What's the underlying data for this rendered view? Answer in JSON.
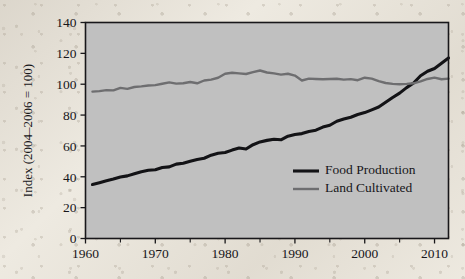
{
  "chart_data": {
    "type": "line",
    "title": "",
    "xlabel": "",
    "ylabel": "Index (2004–2006 = 100)",
    "xlim": [
      1960,
      2012
    ],
    "ylim": [
      0,
      140
    ],
    "grid": false,
    "legend_position": "inside-right-lower",
    "x_ticks": [
      1960,
      1970,
      1980,
      1990,
      2000,
      2010
    ],
    "x_ticks_minor": [
      1965,
      1975,
      1985,
      1995,
      2005
    ],
    "y_ticks": [
      0,
      20,
      40,
      60,
      80,
      100,
      120,
      140
    ],
    "plot_background": "#c3c3c3",
    "page_background": "#eeeae1",
    "x": [
      1961,
      1962,
      1963,
      1964,
      1965,
      1966,
      1967,
      1968,
      1969,
      1970,
      1971,
      1972,
      1973,
      1974,
      1975,
      1976,
      1977,
      1978,
      1979,
      1980,
      1981,
      1982,
      1983,
      1984,
      1985,
      1986,
      1987,
      1988,
      1989,
      1990,
      1991,
      1992,
      1993,
      1994,
      1995,
      1996,
      1997,
      1998,
      1999,
      2000,
      2001,
      2002,
      2003,
      2004,
      2005,
      2006,
      2007,
      2008,
      2009,
      2010,
      2011,
      2012
    ],
    "series": [
      {
        "name": "Food Production",
        "color": "#131316",
        "width": 3.1,
        "values": [
          35.0,
          36.2,
          37.4,
          38.5,
          39.8,
          40.6,
          42.0,
          43.3,
          44.2,
          44.6,
          46.0,
          46.4,
          48.2,
          48.8,
          50.1,
          51.2,
          52.0,
          54.0,
          55.2,
          55.7,
          57.3,
          58.7,
          58.0,
          60.8,
          62.6,
          63.6,
          64.3,
          64.0,
          66.3,
          67.4,
          68.0,
          69.4,
          70.2,
          72.2,
          73.4,
          76.0,
          77.4,
          78.6,
          80.4,
          81.6,
          83.4,
          85.2,
          88.3,
          91.4,
          94.2,
          97.8,
          100.8,
          105.5,
          108.4,
          110.2,
          113.6,
          117.0
        ]
      },
      {
        "name": "Land Cultivated",
        "color": "#6e6e70",
        "width": 2.4,
        "values": [
          95.2,
          95.5,
          96.2,
          96.0,
          97.6,
          97.0,
          98.2,
          98.6,
          99.2,
          99.4,
          100.3,
          101.2,
          100.4,
          100.6,
          101.4,
          100.6,
          102.4,
          103.0,
          104.2,
          106.8,
          107.4,
          107.0,
          106.6,
          107.8,
          108.9,
          107.6,
          107.0,
          106.2,
          106.8,
          105.6,
          102.4,
          103.6,
          103.4,
          103.2,
          103.4,
          103.5,
          103.0,
          103.3,
          102.6,
          104.2,
          103.6,
          102.0,
          100.8,
          100.2,
          100.0,
          100.2,
          100.6,
          101.8,
          103.4,
          104.3,
          103.2,
          103.6
        ]
      }
    ]
  },
  "legend": {
    "items": [
      {
        "label": "Food Production"
      },
      {
        "label": "Land Cultivated"
      }
    ]
  },
  "axes": {
    "y_title": "Index (2004–2006 = 100)",
    "y_tick_labels": [
      "0",
      "20",
      "40",
      "60",
      "80",
      "100",
      "120",
      "140"
    ],
    "x_tick_labels": [
      "1960",
      "1970",
      "1980",
      "1990",
      "2000",
      "2010"
    ]
  }
}
